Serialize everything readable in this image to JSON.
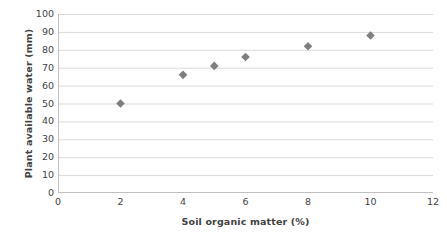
{
  "chart_data": {
    "type": "scatter",
    "title": "",
    "xlabel": "Soil organic matter (%)",
    "ylabel": "Plant available water (mm)",
    "xlim": [
      0,
      12
    ],
    "ylim": [
      0,
      100
    ],
    "xticks": [
      0,
      2,
      4,
      6,
      8,
      10,
      12
    ],
    "yticks": [
      0,
      10,
      20,
      30,
      40,
      50,
      60,
      70,
      80,
      90,
      100
    ],
    "xtick_labels": [
      "0",
      "2",
      "4",
      "6",
      "8",
      "10",
      "12"
    ],
    "ytick_labels": [
      "0",
      "10",
      "20",
      "30",
      "40",
      "50",
      "60",
      "70",
      "80",
      "90",
      "100"
    ],
    "grid": {
      "horizontal": true,
      "vertical": false
    },
    "legend": {
      "visible": false,
      "position": "none"
    },
    "marker": {
      "shape": "diamond",
      "color": "#7f7f7f",
      "size": 7
    },
    "series": [
      {
        "name": "Plant available water",
        "x": [
          2,
          4,
          5,
          6,
          8,
          10
        ],
        "y": [
          50,
          66,
          71,
          76,
          82,
          88
        ],
        "points": [
          {
            "x": 2,
            "y": 50
          },
          {
            "x": 4,
            "y": 66
          },
          {
            "x": 5,
            "y": 71
          },
          {
            "x": 6,
            "y": 76
          },
          {
            "x": 8,
            "y": 82
          },
          {
            "x": 10,
            "y": 88
          }
        ]
      }
    ],
    "colors": {
      "marker": "#7f7f7f",
      "gridline": "#d9d9d9",
      "axis": "#bfbfbf",
      "text": "#3f3f3f",
      "background": "#ffffff"
    }
  }
}
